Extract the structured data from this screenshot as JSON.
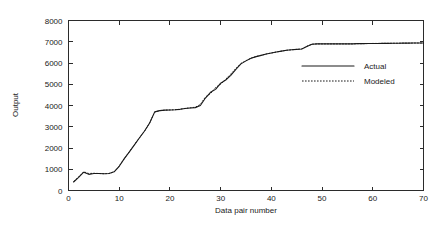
{
  "chart_data": {
    "type": "line",
    "title": "",
    "xlabel": "Data pair number",
    "ylabel": "Output",
    "xlim": [
      0,
      70
    ],
    "ylim": [
      0,
      8000
    ],
    "xticks": [
      0,
      10,
      20,
      30,
      40,
      50,
      60,
      70
    ],
    "yticks": [
      0,
      1000,
      2000,
      3000,
      4000,
      5000,
      6000,
      7000,
      8000
    ],
    "grid": false,
    "legend_position": "center-right",
    "x": [
      1,
      2,
      3,
      4,
      5,
      6,
      7,
      8,
      9,
      10,
      11,
      12,
      13,
      14,
      15,
      16,
      17,
      18,
      19,
      20,
      21,
      22,
      23,
      24,
      25,
      26,
      27,
      28,
      29,
      30,
      31,
      32,
      33,
      34,
      35,
      36,
      37,
      38,
      39,
      40,
      41,
      42,
      43,
      44,
      45,
      46,
      47,
      48,
      49,
      50,
      51,
      52,
      53,
      54,
      55,
      56,
      57,
      58,
      59,
      60,
      61,
      62,
      63,
      64,
      65,
      66,
      67,
      68,
      69,
      70
    ],
    "series": [
      {
        "name": "Actual",
        "style": "solid",
        "values": [
          400,
          620,
          860,
          760,
          800,
          800,
          790,
          800,
          880,
          1140,
          1500,
          1820,
          2150,
          2480,
          2800,
          3180,
          3700,
          3760,
          3780,
          3790,
          3800,
          3820,
          3860,
          3880,
          3900,
          4000,
          4350,
          4620,
          4760,
          5050,
          5200,
          5420,
          5700,
          5960,
          6100,
          6220,
          6300,
          6360,
          6420,
          6470,
          6520,
          6560,
          6600,
          6620,
          6640,
          6660,
          6780,
          6880,
          6900,
          6900,
          6900,
          6900,
          6900,
          6900,
          6900,
          6900,
          6910,
          6910,
          6915,
          6920,
          6920,
          6925,
          6925,
          6930,
          6930,
          6935,
          6935,
          6940,
          6940,
          6940
        ]
      },
      {
        "name": "Modeled",
        "style": "dotted",
        "values": [
          420,
          640,
          880,
          800,
          810,
          800,
          790,
          800,
          880,
          1150,
          1500,
          1820,
          2160,
          2480,
          2800,
          3180,
          3690,
          3760,
          3780,
          3790,
          3800,
          3825,
          3865,
          3890,
          3920,
          4050,
          4400,
          4560,
          4850,
          5000,
          5240,
          5480,
          5740,
          5980,
          6110,
          6230,
          6305,
          6365,
          6425,
          6470,
          6520,
          6560,
          6600,
          6620,
          6640,
          6665,
          6790,
          6885,
          6900,
          6900,
          6900,
          6900,
          6900,
          6900,
          6900,
          6900,
          6910,
          6910,
          6915,
          6920,
          6920,
          6925,
          6925,
          6930,
          6930,
          6935,
          6935,
          6940,
          6940,
          6940
        ]
      }
    ],
    "legend": [
      {
        "label": "Actual",
        "style": "solid"
      },
      {
        "label": "Modeled",
        "style": "dotted"
      }
    ]
  }
}
